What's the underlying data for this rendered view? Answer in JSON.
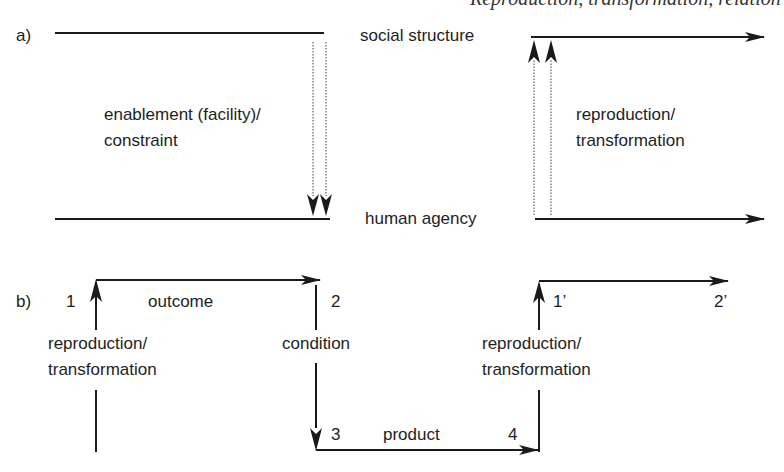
{
  "header": {
    "clipped_caption": "Reproduction, transformation, relation"
  },
  "panel_a": {
    "label": "a)",
    "top_level": "social structure",
    "bottom_level": "human agency",
    "downward_label_line1": "enablement (facility)/",
    "downward_label_line2": "constraint",
    "upward_label_line1": "reproduction/",
    "upward_label_line2": "transformation"
  },
  "panel_b": {
    "label": "b)",
    "points": [
      "1",
      "2",
      "3",
      "4",
      "1’",
      "2’"
    ],
    "edge_outcome": "outcome",
    "edge_condition": "condition",
    "edge_product": "product",
    "left_label_line1": "reproduction/",
    "left_label_line2": "transformation",
    "right_label_line1": "reproduction/",
    "right_label_line2": "transformation"
  },
  "colors": {
    "line": "#1a1a1a",
    "dotted": "#777777",
    "background": "#ffffff"
  }
}
